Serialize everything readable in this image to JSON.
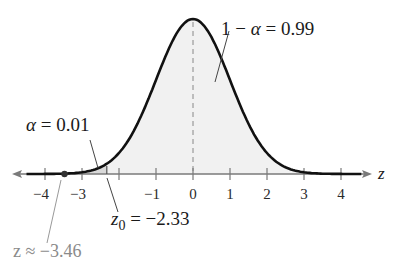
{
  "chart_data": {
    "type": "area",
    "title": "",
    "xlabel": "z",
    "ylabel": "",
    "xlim": [
      -4.5,
      4.7
    ],
    "x_ticks": [
      -4,
      -3,
      -2,
      -1,
      0,
      1,
      2,
      3,
      4
    ],
    "x_tick_labels": [
      "−4",
      "−3",
      "",
      "−1",
      "0",
      "1",
      "2",
      "3",
      "4"
    ],
    "grid": false,
    "curve": "standard normal density",
    "mean": 0,
    "std": 1,
    "shaded_regions": [
      {
        "name": "rejection region",
        "from": -4.5,
        "to": -2.33,
        "area": 0.01
      },
      {
        "name": "non-rejection region",
        "from": -2.33,
        "to": 4.7,
        "area": 0.99
      }
    ],
    "critical_value": -2.33,
    "test_statistic": -3.46,
    "annotations": [
      {
        "text": "1 − α = 0.99",
        "points_to": "region right of z0"
      },
      {
        "text": "α = 0.01",
        "points_to": "left tail area"
      },
      {
        "text": "z₀ = −2.33",
        "points_to": "critical value"
      },
      {
        "text": "z ≈ −3.46",
        "points_to": "test statistic point"
      }
    ]
  },
  "labels": {
    "axis_var": "z",
    "ticks": {
      "m4": "−4",
      "m3": "−3",
      "m1": "−1",
      "p0": "0",
      "p1": "1",
      "p2": "2",
      "p3": "3",
      "p4": "4"
    },
    "one_minus_alpha_lhs": "1 − ",
    "alpha_sym": "α",
    "one_minus_alpha_rhs": " = 0.99",
    "alpha_rhs": " = 0.01",
    "z0_base": "z",
    "z0_sub": "0",
    "z0_rhs": " = −2.33",
    "z_stat": "z ≈ −3.46"
  },
  "colors": {
    "curve": "#111111",
    "fill": "#f1f1f1",
    "tail_fill": "#d9d9d9",
    "axis": "#7a7a7a",
    "gray_text": "#8a8a8a"
  }
}
